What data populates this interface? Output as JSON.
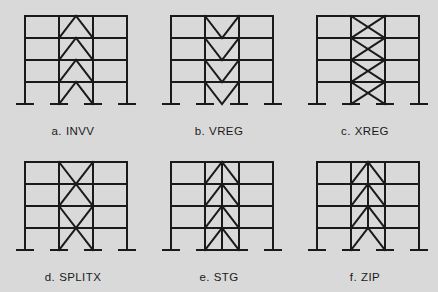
{
  "figure": {
    "background_color": "#d9d9d9",
    "line_color": "#1a1a1a",
    "stories": 4,
    "bays": 3,
    "braced_bay": "middle",
    "frames": [
      {
        "key": "invv",
        "letter": "a.",
        "label": "INVV",
        "caption": "a. INVV",
        "bracing": "inverted-V chevron each story, apex up",
        "has_center_column": false,
        "center_column_base_support": false
      },
      {
        "key": "vreg",
        "letter": "b.",
        "label": "VREG",
        "caption": "b. VREG",
        "bracing": "V chevron each story, apex down",
        "has_center_column": false,
        "center_column_base_support": false
      },
      {
        "key": "xreg",
        "letter": "c.",
        "label": "XREG",
        "caption": "c. XREG",
        "bracing": "X brace each story",
        "has_center_column": false,
        "center_column_base_support": false
      },
      {
        "key": "splitx",
        "letter": "d.",
        "label": "SPLITX",
        "caption": "d. SPLITX",
        "bracing": "X brace spanning two stories, split over height",
        "has_center_column": false,
        "center_column_base_support": false
      },
      {
        "key": "stg",
        "letter": "e.",
        "label": "STG",
        "caption": "e. STG",
        "bracing": "chevron each story with full-height central column",
        "has_center_column": true,
        "center_column_base_support": true
      },
      {
        "key": "zip",
        "letter": "f.",
        "label": "ZIP",
        "caption": "f. ZIP",
        "bracing": "chevron each story with zipper column stopping above ground floor",
        "has_center_column": true,
        "center_column_base_support": false
      }
    ]
  }
}
